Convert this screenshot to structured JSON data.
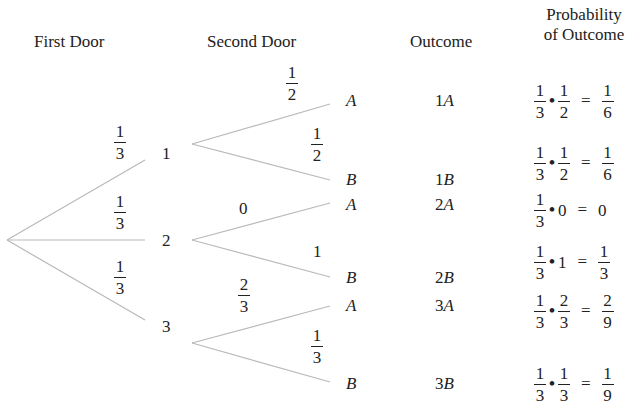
{
  "headers": {
    "first_door": "First Door",
    "second_door": "Second Door",
    "outcome": "Outcome",
    "probability_line1": "Probability",
    "probability_line2": "of Outcome"
  },
  "first_level": {
    "branches": [
      {
        "node": "1",
        "prob_num": "1",
        "prob_den": "3"
      },
      {
        "node": "2",
        "prob_num": "1",
        "prob_den": "3"
      },
      {
        "node": "3",
        "prob_num": "1",
        "prob_den": "3"
      }
    ]
  },
  "second_level": {
    "branches": [
      {
        "from": "1",
        "leaf": "A",
        "prob_num": "1",
        "prob_den": "2"
      },
      {
        "from": "1",
        "leaf": "B",
        "prob_num": "1",
        "prob_den": "2"
      },
      {
        "from": "2",
        "leaf": "A",
        "prob_whole": "0"
      },
      {
        "from": "2",
        "leaf": "B",
        "prob_whole": "1"
      },
      {
        "from": "3",
        "leaf": "A",
        "prob_num": "2",
        "prob_den": "3"
      },
      {
        "from": "3",
        "leaf": "B",
        "prob_num": "1",
        "prob_den": "3"
      }
    ]
  },
  "outcomes": [
    {
      "label_num": "1",
      "label_letter": "A",
      "a_num": "1",
      "a_den": "3",
      "b_num": "1",
      "b_den": "2",
      "r_num": "1",
      "r_den": "6"
    },
    {
      "label_num": "1",
      "label_letter": "B",
      "a_num": "1",
      "a_den": "3",
      "b_num": "1",
      "b_den": "2",
      "r_num": "1",
      "r_den": "6"
    },
    {
      "label_num": "2",
      "label_letter": "A",
      "a_num": "1",
      "a_den": "3",
      "b_whole": "0",
      "r_whole": "0"
    },
    {
      "label_num": "2",
      "label_letter": "B",
      "a_num": "1",
      "a_den": "3",
      "b_whole": "1",
      "r_num": "1",
      "r_den": "3"
    },
    {
      "label_num": "3",
      "label_letter": "A",
      "a_num": "1",
      "a_den": "3",
      "b_num": "2",
      "b_den": "3",
      "r_num": "2",
      "r_den": "9"
    },
    {
      "label_num": "3",
      "label_letter": "B",
      "a_num": "1",
      "a_den": "3",
      "b_num": "1",
      "b_den": "3",
      "r_num": "1",
      "r_den": "9"
    }
  ],
  "symbols": {
    "dot": "•",
    "equals": "="
  },
  "colors": {
    "line": "#b9b9b9",
    "text": "#222222"
  }
}
